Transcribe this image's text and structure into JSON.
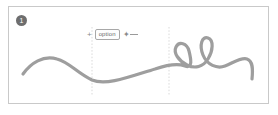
{
  "panel": {
    "name": "sketch-canvas-panel",
    "background": "#ffffff",
    "border_color": "#c9c9c9"
  },
  "badge": {
    "label": "1",
    "background": "#6e6e6e",
    "text_color": "#ffffff"
  },
  "hint": {
    "plus_left": "+",
    "key_label": "option",
    "drag_symbol": "✦",
    "icons": {
      "crosshair": "crosshair-icon",
      "drag_arrow": "drag-arrow-icon"
    }
  },
  "guides": {
    "color": "#cfcfcf",
    "style": "dashed",
    "positions": [
      83,
      160
    ]
  },
  "stroke": {
    "color": "#9e9e9e",
    "width": 3.2,
    "linecap": "round",
    "linejoin": "round"
  },
  "chart_data": {
    "type": "line",
    "title": "",
    "xlabel": "",
    "ylabel": "",
    "grid": false,
    "legend": null,
    "path": "M 14 67 C 22 56, 34 48, 48 52 C 60 55, 68 66, 83 73 C 97 79, 120 70, 146 62 C 158 58, 168 56, 176 59 C 184 62, 182 52, 180 44 C 178 36, 170 34, 167 40 C 164 46, 170 54, 178 58 C 186 62, 194 60, 199 52 C 204 44, 205 33, 199 31 C 193 29, 190 38, 194 48 C 198 58, 208 62, 216 59 C 224 56, 232 50, 238 52 C 244 54, 244 62, 243 72",
    "anchors": [
      {
        "x": 14,
        "y": 67,
        "kind": "start"
      },
      {
        "x": 48,
        "y": 52,
        "kind": "peak"
      },
      {
        "x": 83,
        "y": 73,
        "kind": "trough"
      },
      {
        "x": 167,
        "y": 40,
        "kind": "loop-1"
      },
      {
        "x": 199,
        "y": 31,
        "kind": "loop-2"
      },
      {
        "x": 243,
        "y": 72,
        "kind": "end"
      }
    ]
  }
}
